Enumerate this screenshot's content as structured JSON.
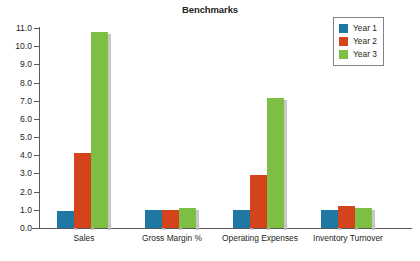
{
  "chart_data": {
    "type": "bar",
    "title": "Benchmarks",
    "xlabel": "",
    "ylabel": "",
    "categories": [
      "Sales",
      "Gross Margin %",
      "Operating Expenses",
      "Inventory Turnover"
    ],
    "series": [
      {
        "name": "Year 1",
        "color": "#1f77a4",
        "values": [
          0.95,
          1.0,
          1.0,
          1.0
        ]
      },
      {
        "name": "Year 2",
        "color": "#d4431c",
        "values": [
          4.15,
          1.0,
          2.9,
          1.2
        ]
      },
      {
        "name": "Year 3",
        "color": "#7dbf42",
        "values": [
          10.8,
          1.1,
          7.15,
          1.1
        ]
      }
    ],
    "ylim": [
      0.0,
      11.0
    ],
    "ytick_step": 1.0,
    "ytick_labels": [
      "0.0",
      "1.0",
      "2.0",
      "3.0",
      "4.0",
      "5.0",
      "6.0",
      "7.0",
      "8.0",
      "9.0",
      "10.0",
      "11.0"
    ],
    "grid": false,
    "legend_position": "top-right",
    "legend_entries": [
      "Year 1",
      "Year 2",
      "Year 3"
    ],
    "bar_shadow_color": "#bcbec0",
    "axis_color": "#58595b"
  }
}
